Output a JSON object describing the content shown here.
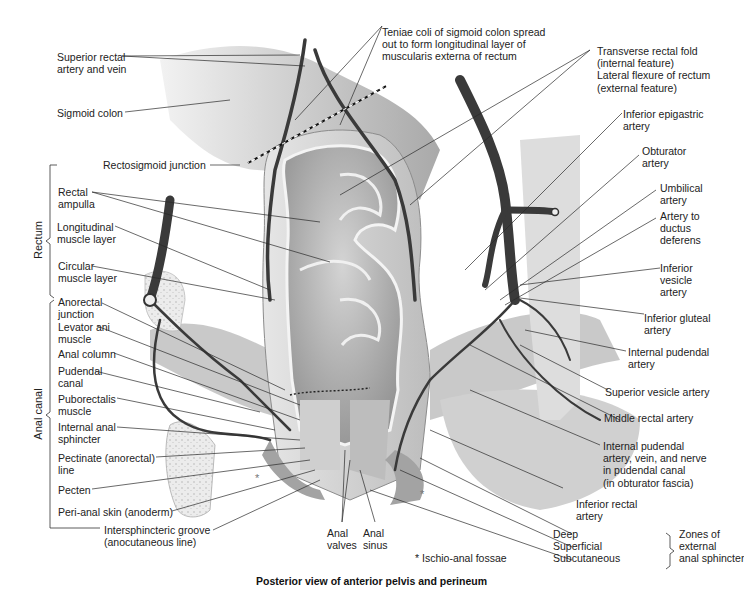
{
  "figure": {
    "caption": "Posterior view of anterior pelvis and perineum",
    "colors": {
      "background": "#ffffff",
      "text": "#222222",
      "tissue_light": "#d9d9d9",
      "tissue_mid": "#a8a8a8",
      "vessel": "#3a3a3a",
      "leader": "#2a2a2a"
    }
  },
  "groups": {
    "rectum": "Rectum",
    "anal_canal": "Anal canal",
    "zones": "Zones of\nexternal\nanal sphincter"
  },
  "labels_left": [
    {
      "id": "superior-rectal",
      "text": "Superior rectal\nartery and vein"
    },
    {
      "id": "sigmoid-colon",
      "text": "Sigmoid colon"
    },
    {
      "id": "rectosigmoid-junction",
      "text": "Rectosigmoid junction"
    },
    {
      "id": "rectal-ampulla",
      "text": "Rectal\nampulla"
    },
    {
      "id": "longitudinal-muscle",
      "text": "Longitudinal\nmuscle layer"
    },
    {
      "id": "circular-muscle",
      "text": "Circular\nmuscle layer"
    },
    {
      "id": "anorectal-junction",
      "text": "Anorectal\njunction"
    },
    {
      "id": "levator-ani",
      "text": "Levator ani\nmuscle"
    },
    {
      "id": "anal-column",
      "text": "Anal column"
    },
    {
      "id": "pudendal-canal",
      "text": "Pudendal\ncanal"
    },
    {
      "id": "puborectalis",
      "text": "Puborectalis\nmuscle"
    },
    {
      "id": "internal-anal-sphincter",
      "text": "Internal anal\nsphincter"
    },
    {
      "id": "pectinate-line",
      "text": "Pectinate (anorectal)\nline"
    },
    {
      "id": "pecten",
      "text": "Pecten"
    },
    {
      "id": "peri-anal-skin",
      "text": "Peri-anal skin (anoderm)"
    },
    {
      "id": "intersphincteric-groove",
      "text": "Intersphincteric groove\n(anocutaneous line)"
    }
  ],
  "labels_top": [
    {
      "id": "teniae-coli",
      "text": "Teniae coli of sigmoid colon spread\nout to form longitudinal layer of\nmuscularis externa of rectum"
    }
  ],
  "labels_right": [
    {
      "id": "transverse-rectal-fold",
      "text": "Transverse rectal fold\n(internal feature)\nLateral flexure of rectum\n(external feature)"
    },
    {
      "id": "inferior-epigastric",
      "text": "Inferior epigastric\nartery"
    },
    {
      "id": "obturator-artery",
      "text": "Obturator\nartery"
    },
    {
      "id": "umbilical-artery",
      "text": "Umbilical\nartery"
    },
    {
      "id": "artery-ductus-deferens",
      "text": "Artery to\nductus\ndeferens"
    },
    {
      "id": "inferior-vesicle",
      "text": "Inferior\nvesicle\nartery"
    },
    {
      "id": "inferior-gluteal",
      "text": "Inferior gluteal\nartery"
    },
    {
      "id": "internal-pudendal-artery",
      "text": "Internal pudendal\nartery"
    },
    {
      "id": "superior-vesicle",
      "text": "Superior vesicle artery"
    },
    {
      "id": "middle-rectal",
      "text": "Middle rectal artery"
    },
    {
      "id": "internal-pudendal-canal",
      "text": "Internal pudendal\nartery, vein, and nerve\nin pudendal canal\n(in obturator fascia)"
    },
    {
      "id": "inferior-rectal",
      "text": "Inferior rectal\nartery"
    }
  ],
  "labels_bottom": [
    {
      "id": "anal-valves",
      "text": "Anal\nvalves"
    },
    {
      "id": "anal-sinus",
      "text": "Anal\nsinus"
    },
    {
      "id": "ischio-anal-fossae",
      "text": "* Ischio-anal fossae"
    },
    {
      "id": "zones-list",
      "text": "Deep\nSuperficial\nSubcutaneous"
    }
  ]
}
